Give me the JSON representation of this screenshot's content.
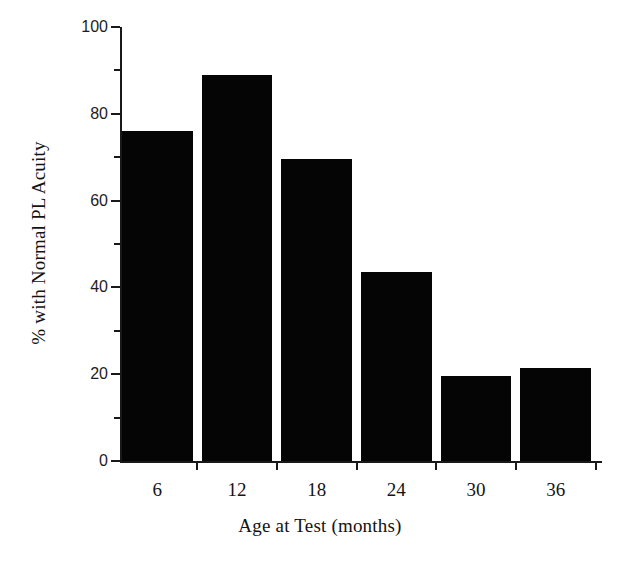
{
  "chart_data": {
    "type": "bar",
    "title": "",
    "xlabel": "Age at Test (months)",
    "ylabel": "% with Normal PL Acuity",
    "categories": [
      "6",
      "12",
      "18",
      "24",
      "30",
      "36"
    ],
    "values": [
      76,
      89,
      69.5,
      43.5,
      19.5,
      21.5
    ],
    "ylim": [
      0,
      100
    ],
    "ytick_labels": [
      "0",
      "20",
      "40",
      "60",
      "80",
      "100"
    ],
    "ytick_values": [
      0,
      20,
      40,
      60,
      80,
      100
    ],
    "yminor_values": [
      10,
      30,
      50,
      70,
      90
    ],
    "grid": false,
    "legend": false,
    "bar_color": "#050505",
    "axis_color": "#191919"
  }
}
